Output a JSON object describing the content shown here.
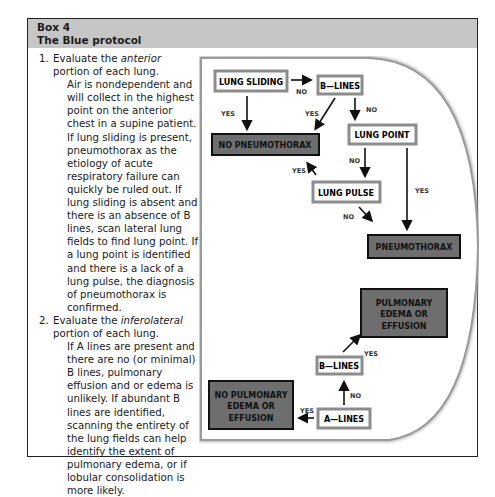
{
  "box": {
    "number": "Box 4",
    "title": "The Blue protocol"
  },
  "steps": [
    {
      "num": "1.",
      "head_pre": "Evaluate the ",
      "head_em": "anterior",
      "head_post": " portion of each lung.",
      "body": "Air is nondependent and will collect in the highest point on the anterior chest in a supine patient. If lung sliding is present, pneumothorax as the etiology of acute respiratory failure can quickly be ruled out. If lung sliding is absent and there is an absence of B lines, scan lateral lung fields to find lung point. If a lung point is identified and there is a lack of a lung pulse, the diagnosis of pneumothorax is confirmed."
    },
    {
      "num": "2.",
      "head_pre": "Evaluate the ",
      "head_em": "inferolateral",
      "head_post": " portion of each lung.",
      "body": "If A lines are present and there are no (or minimal) B lines, pulmonary effusion and or edema is unlikely. If abundant B lines are identified, scanning the entirety of the lung fields can help identify the extent of pulmonary edema, or if lobular consolidation is more likely."
    }
  ],
  "diagram": {
    "nodes": {
      "lung_sliding": "LUNG SLIDING",
      "b_lines_top": "B—LINES",
      "no_pneumothorax": "NO PNEUMOTHORAX",
      "lung_point": "LUNG POINT",
      "lung_pulse": "LUNG PULSE",
      "pneumothorax": "PNEUMOTHORAX",
      "pulmonary_edema": [
        "PULMONARY",
        "EDEMA OR",
        "EFFUSION"
      ],
      "b_lines_bottom": "B—LINES",
      "a_lines": "A—LINES",
      "no_pulmonary_edema": [
        "NO PULMONARY",
        "EDEMA OR",
        "EFFUSION"
      ]
    },
    "labels": {
      "yes": "YES",
      "no": "NO"
    },
    "colors": {
      "header_band": "#c6c6c6",
      "outcome_fill": "#6e6e6e",
      "node_border": "#8c8c8c",
      "arc": "#9a9a9a"
    }
  }
}
